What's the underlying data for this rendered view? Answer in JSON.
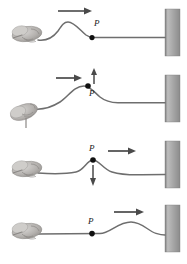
{
  "figure": {
    "background_color": "#ffffff",
    "rope_color": "#6e6e6e",
    "wall_color": "#9a9a9a",
    "arrow_color": "#4a4a4a",
    "point_color": "#111111",
    "label_color": "#1a1a1a",
    "width": 187,
    "height": 264,
    "panel_count": 4
  },
  "panels": [
    {
      "index": 1,
      "point_label": "P",
      "point_label_position": "above-right",
      "pulse_arrow": "arrow-right",
      "velocity_arrow": "none",
      "description": "Hand has just flicked the rope; pulse crest is left of point P which still rests on the undisturbed rope.",
      "point_x": 92,
      "point_y": 37,
      "crest_x": 66,
      "crest_y": 22
    },
    {
      "index": 2,
      "point_label": "P",
      "point_label_position": "below-right",
      "pulse_arrow": "arrow-right",
      "velocity_arrow": "arrow-up",
      "description": "Pulse reaches P; the point moves upward as the leading edge of the pulse passes.",
      "point_x": 88,
      "point_y": 84,
      "crest_x": 84,
      "crest_y": 82
    },
    {
      "index": 3,
      "point_label": "P",
      "point_label_position": "above",
      "pulse_arrow": "arrow-right",
      "velocity_arrow": "arrow-down",
      "description": "P sits at the top of the crest and is about to move downward as the trailing edge passes.",
      "point_x": 93,
      "point_y": 160,
      "crest_x": 93,
      "crest_y": 159
    },
    {
      "index": 4,
      "point_label": "P",
      "point_label_position": "above",
      "pulse_arrow": "arrow-right",
      "velocity_arrow": "none",
      "description": "Pulse has passed P, which is back at rest; the crest continues toward the wall.",
      "point_x": 92,
      "point_y": 230,
      "crest_x": 131,
      "crest_y": 216
    }
  ],
  "elements": {
    "hand_label": "hand gripping rope",
    "wall_label": "fixed wall",
    "rope_label": "rope",
    "point_label": "point P on rope"
  }
}
